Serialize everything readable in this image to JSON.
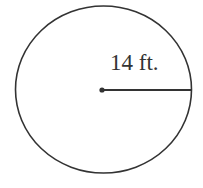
{
  "diagram": {
    "shape": "circle",
    "radius_label": "14 ft.",
    "stroke_color": "#333333",
    "background": "#ffffff"
  }
}
